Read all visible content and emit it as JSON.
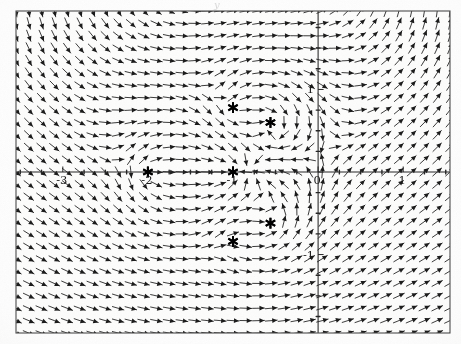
{
  "figure": {
    "kind": "direction-field",
    "top_label": "y",
    "background_color": "#fdfdfd",
    "ink_color": "#1a1a1a",
    "frame_color": "#555555"
  },
  "chart_data": {
    "type": "scatter",
    "title": "",
    "subtitle": "",
    "xlabel": "",
    "ylabel": "y",
    "grid": false,
    "legend": null,
    "plot_style": "vector field (quiver) with critical points marked by stars",
    "xlim": [
      -3.55,
      1.55
    ],
    "ylim": [
      -1.95,
      1.95
    ],
    "x_ticks": [
      -3,
      -2,
      -1,
      0,
      1
    ],
    "x_tick_labels": [
      "-3",
      "-2",
      "-1",
      "0",
      "1"
    ],
    "y_ticks": [
      -1,
      1
    ],
    "y_tick_labels": [
      "-1",
      "1"
    ],
    "minor_tick_spacing_x": 0.25,
    "minor_tick_spacing_y": 0.25,
    "axis_lines": {
      "x_axis_at_y": 0,
      "y_axis_at_x": 0
    },
    "quiver": {
      "grid_nx": 34,
      "grid_ny": 26,
      "arrow_color": "#1a1a1a",
      "normalized": true,
      "description": "unit-length arrows showing flow direction"
    },
    "series": [
      {
        "name": "critical points",
        "marker": "star",
        "marker_color": "#000000",
        "points": [
          {
            "x": -2.0,
            "y": 0.0,
            "label": ""
          },
          {
            "x": -1.0,
            "y": 0.0,
            "label": ""
          },
          {
            "x": -1.0,
            "y": 0.78,
            "label": ""
          },
          {
            "x": -0.56,
            "y": 0.6,
            "label": ""
          },
          {
            "x": -1.0,
            "y": -0.84,
            "label": ""
          },
          {
            "x": -0.56,
            "y": -0.62,
            "label": ""
          }
        ]
      }
    ]
  },
  "frame": {
    "left_px": 16,
    "top_px": 11,
    "right_px": 450,
    "bottom_px": 333
  }
}
